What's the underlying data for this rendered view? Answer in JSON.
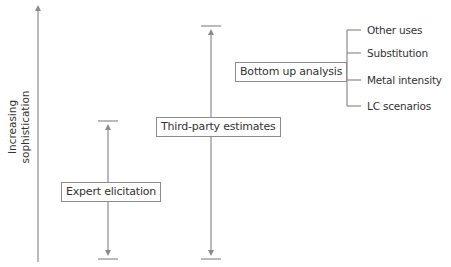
{
  "diagram": {
    "axis": {
      "label_line1": "Increasing",
      "label_line2": "sophistication",
      "direction": "up"
    },
    "methods": [
      {
        "label": "Expert elicitation",
        "range": "low"
      },
      {
        "label": "Third-party estimates",
        "range": "full"
      },
      {
        "label": "Bottom up analysis"
      }
    ],
    "bottom_up_components": [
      {
        "label": "Other uses"
      },
      {
        "label": "Substitution"
      },
      {
        "label": "Metal intensity"
      },
      {
        "label": "LC scenarios"
      }
    ],
    "colors": {
      "line": "#8c8c8c",
      "text": "#333333",
      "background": "#ffffff"
    }
  }
}
